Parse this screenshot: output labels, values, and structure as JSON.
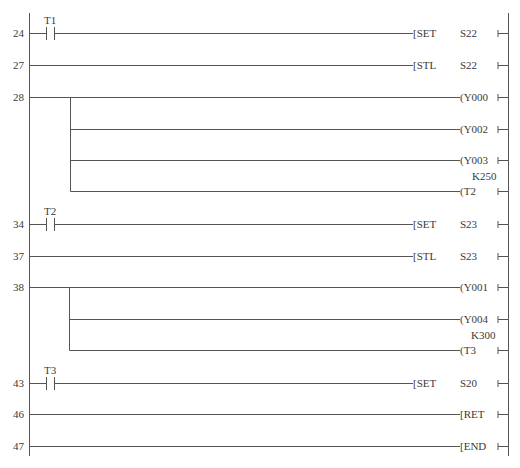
{
  "diagram": {
    "type": "ladder",
    "rungs": [
      {
        "step": "24",
        "contact": "T1",
        "instruction": "SET",
        "operand": "S22",
        "kind": "apply"
      },
      {
        "step": "27",
        "contact": null,
        "instruction": "STL",
        "operand": "S22",
        "kind": "apply"
      },
      {
        "step": "28",
        "contact": null,
        "outputs": [
          "Y000",
          "Y002",
          "Y003",
          "T2"
        ],
        "timer_constant": "K250"
      },
      {
        "step": "34",
        "contact": "T2",
        "instruction": "SET",
        "operand": "S23",
        "kind": "apply"
      },
      {
        "step": "37",
        "contact": null,
        "instruction": "STL",
        "operand": "S23",
        "kind": "apply"
      },
      {
        "step": "38",
        "contact": null,
        "outputs": [
          "Y001",
          "Y004",
          "T3"
        ],
        "timer_constant": "K300"
      },
      {
        "step": "43",
        "contact": "T3",
        "instruction": "SET",
        "operand": "S20",
        "kind": "apply"
      },
      {
        "step": "46",
        "contact": null,
        "instruction": "RET",
        "operand": "",
        "kind": "apply"
      },
      {
        "step": "47",
        "contact": null,
        "instruction": "END",
        "operand": "",
        "kind": "apply"
      }
    ]
  },
  "labels": {
    "r24": {
      "step": "24",
      "contact": "T1",
      "instr": "[SET",
      "operand": "S22"
    },
    "r27": {
      "step": "27",
      "instr": "[STL",
      "operand": "S22"
    },
    "r28": {
      "step": "28",
      "out1": "(Y000",
      "out2": "(Y002",
      "out3": "(Y003",
      "k": "K250",
      "out4": "(T2"
    },
    "r34": {
      "step": "34",
      "contact": "T2",
      "instr": "[SET",
      "operand": "S23"
    },
    "r37": {
      "step": "37",
      "instr": "[STL",
      "operand": "S23"
    },
    "r38": {
      "step": "38",
      "out1": "(Y001",
      "out2": "(Y004",
      "k": "K300",
      "out3": "(T3"
    },
    "r43": {
      "step": "43",
      "contact": "T3",
      "instr": "[SET",
      "operand": "S20"
    },
    "r46": {
      "step": "46",
      "instr": "[RET"
    },
    "r47": {
      "step": "47",
      "instr": "[END"
    }
  },
  "colors": {
    "line": "#555555",
    "text": "#3a3a3a",
    "background": "#ffffff"
  }
}
